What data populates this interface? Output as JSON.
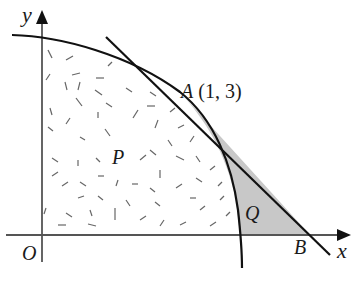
{
  "diagram": {
    "type": "coordinate-geometry-figure",
    "axes": {
      "x_label": "x",
      "y_label": "y",
      "origin_label": "O"
    },
    "points": {
      "A": {
        "label": "A",
        "coords_text": "(1, 3)"
      },
      "B": {
        "label": "B"
      }
    },
    "regions": {
      "P": {
        "label": "P",
        "fill": "random dashes (stippled)"
      },
      "Q": {
        "label": "Q",
        "fill": "#c8c8c8"
      }
    },
    "elements": [
      "curve passing through A, meeting x-axis to the left of B",
      "tangent line to the curve at A, meeting x-axis at B"
    ],
    "colors": {
      "curve": "#111111",
      "axes": "#555555",
      "shade": "#c8c8c8",
      "dashes": "#666666"
    }
  }
}
